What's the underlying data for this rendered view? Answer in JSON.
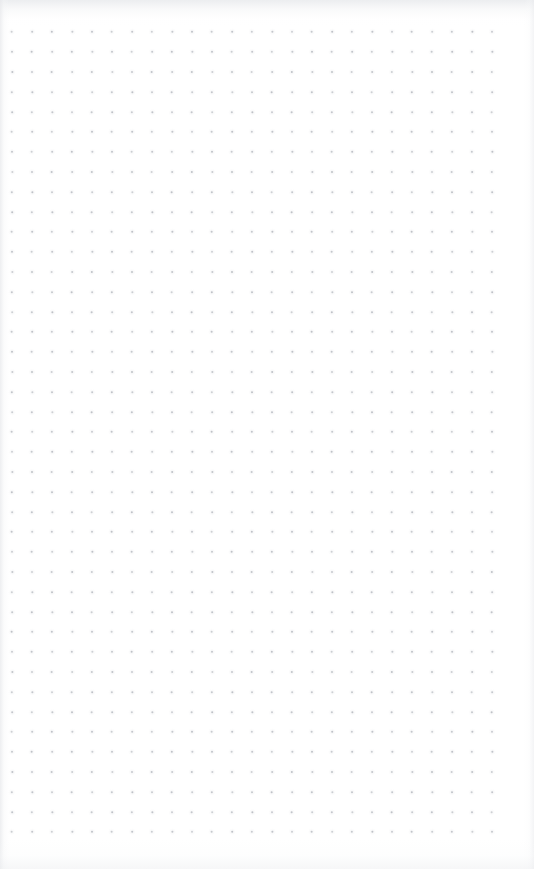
{
  "page": {
    "kind": "dot-grid-notebook-page",
    "width": 534,
    "height": 869,
    "background_color": "#fefefe",
    "paper_tone_color": "#f7f8f9"
  },
  "grid": {
    "name": "dot-grid",
    "dot_color": "#bdc0c6",
    "dot_size_px": 2,
    "spacing_px": 20,
    "origin_x_px": 12,
    "origin_y_px": 32,
    "columns": 25,
    "rows": 41,
    "margin_left_px": 12,
    "margin_top_px": 32,
    "margin_right_px": 42,
    "margin_bottom_px": 42
  },
  "content": {
    "text": "",
    "annotations": [],
    "note": ""
  }
}
